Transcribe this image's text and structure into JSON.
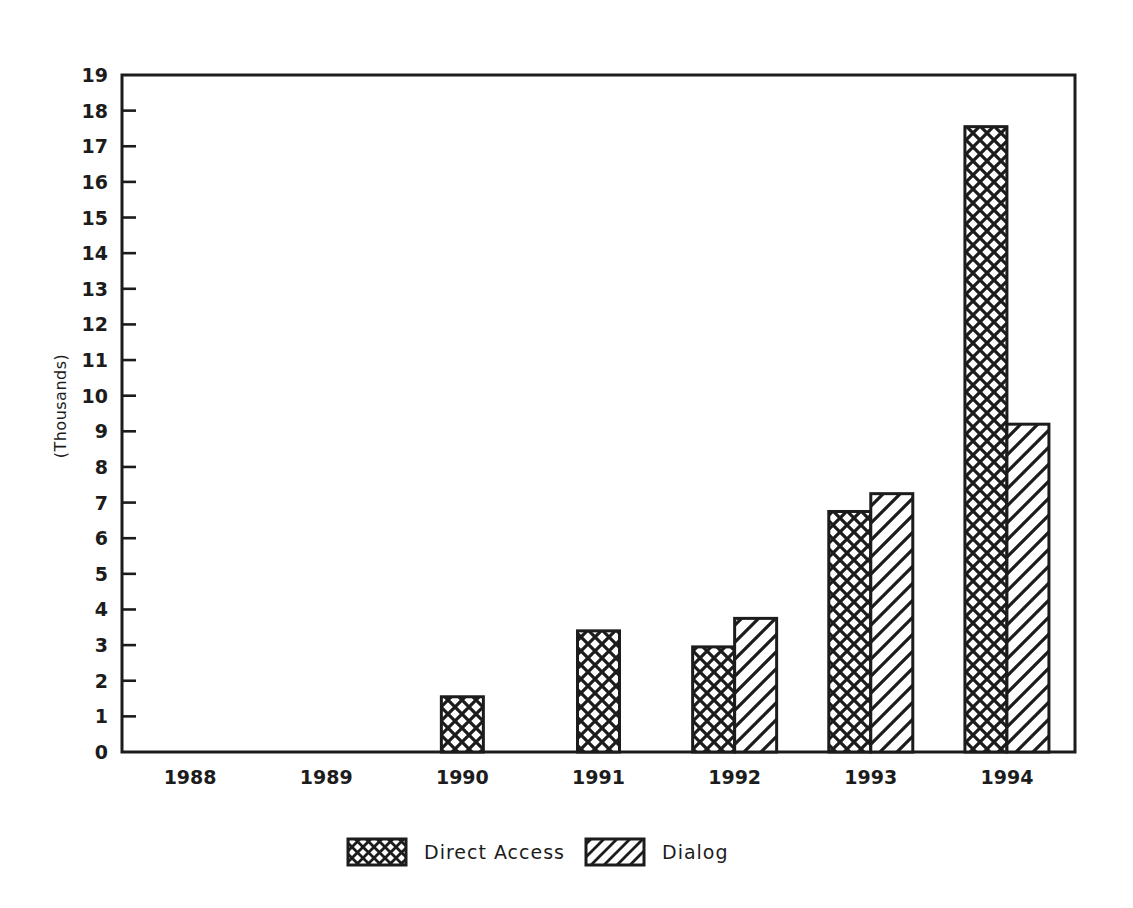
{
  "chart_data": {
    "type": "bar",
    "title": "",
    "subtitle": "",
    "xlabel": "",
    "ylabel": "(Thousands)",
    "categories": [
      "1988",
      "1989",
      "1990",
      "1991",
      "1992",
      "1993",
      "1994"
    ],
    "series": [
      {
        "name": "Direct Access",
        "pattern": "crosshatch",
        "values": [
          0,
          0,
          1.55,
          3.4,
          2.95,
          6.75,
          17.55
        ]
      },
      {
        "name": "Dialog",
        "pattern": "diagonal-hatch",
        "values": [
          0,
          0,
          0,
          0,
          3.75,
          7.25,
          9.2
        ]
      }
    ],
    "ylim": [
      0,
      19
    ],
    "ytick_values": [
      0,
      1,
      2,
      3,
      4,
      5,
      6,
      7,
      8,
      9,
      10,
      11,
      12,
      13,
      14,
      15,
      16,
      17,
      18,
      19
    ],
    "ytick_labels": [
      "0",
      "1",
      "2",
      "3",
      "4",
      "5",
      "6",
      "7",
      "8",
      "9",
      "10",
      "11",
      "12",
      "13",
      "14",
      "15",
      "16",
      "17",
      "18",
      "19"
    ],
    "grid": false,
    "legend_position": "bottom",
    "legend_entries": [
      {
        "label": "Direct Access",
        "pattern": "crosshatch"
      },
      {
        "label": "Dialog",
        "pattern": "diagonal-hatch"
      }
    ],
    "colors": {
      "axis": "#1c1c1c",
      "bar_outline": "#1c1c1c",
      "bar_fill": "#ffffff",
      "hatch": "#1c1c1c",
      "background": "#ffffff"
    }
  }
}
